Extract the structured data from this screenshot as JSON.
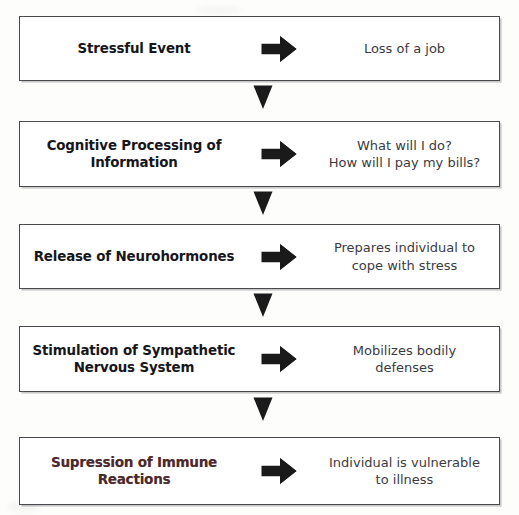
{
  "diagram": {
    "type": "vertical-flowchart",
    "colors": {
      "background": "#fdfdfc",
      "box_fill": "#ffffff",
      "box_border": "#4a4a4e",
      "label_text": "#17161a",
      "label_text_tinted": "#4a2a2c",
      "description_text": "#3b3b3f",
      "arrow_fill": "#1a1a1a"
    },
    "connector_icon": "down-triangle-arrow-icon",
    "step_arrow_icon": "right-block-arrow-icon",
    "steps": [
      {
        "index": 1,
        "label": "Stressful Event",
        "label_lines": [
          "Stressful Event"
        ],
        "description_lines": [
          "Loss of a job"
        ],
        "tinted": false
      },
      {
        "index": 2,
        "label": "Cognitive Processing of Information",
        "label_lines": [
          "Cognitive Processing of",
          "Information"
        ],
        "description_lines": [
          "What will I do?",
          "How will I pay my bills?"
        ],
        "tinted": false
      },
      {
        "index": 3,
        "label": "Release of Neurohormones",
        "label_lines": [
          "Release of",
          "Neurohormones"
        ],
        "description_lines": [
          "Prepares individual to",
          "cope with stress"
        ],
        "tinted": false
      },
      {
        "index": 4,
        "label": "Stimulation of Sympathetic Nervous System",
        "label_lines": [
          "Stimulation of Sympathetic",
          "Nervous System"
        ],
        "description_lines": [
          "Mobilizes bodily",
          "defenses"
        ],
        "tinted": false
      },
      {
        "index": 5,
        "label": "Supression of Immune Reactions",
        "label_lines": [
          "Supression of Immune",
          "Reactions"
        ],
        "description_lines": [
          "Individual is vulnerable",
          "to illness"
        ],
        "tinted": true
      }
    ]
  }
}
